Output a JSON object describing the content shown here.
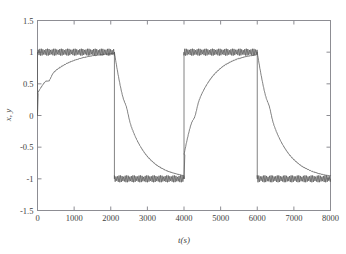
{
  "figure": {
    "scan_artifact_text": "· ·· ·· ···· ··· · ···· ·· ···· ··· ·· ····· ··· ··",
    "background_color": "#ffffff",
    "axis_color": "#8d8d93",
    "trace_color": "#585858"
  },
  "chart_data": {
    "type": "line",
    "title": "",
    "xlabel": "t(s)",
    "ylabel": "x, y",
    "xlim": [
      0,
      8000
    ],
    "ylim": [
      -1.5,
      1.5
    ],
    "xticks": [
      0,
      1000,
      2000,
      3000,
      4000,
      5000,
      6000,
      7000,
      8000
    ],
    "xticklabels": [
      "0",
      "1000",
      "2000",
      "3000",
      "4000",
      "5000",
      "6000",
      "7000",
      "8000"
    ],
    "yticks": [
      -1.5,
      -1,
      -0.5,
      0,
      0.5,
      1,
      1.5
    ],
    "yticklabels": [
      "-1.5",
      "-1",
      "-0.5",
      "0",
      "0.5",
      "1",
      "1.5"
    ],
    "grid": false,
    "legend": null,
    "annotations": [],
    "series": [
      {
        "name": "x",
        "description": "reference square wave with high-frequency chattering ripple on plateaus",
        "style": "chattering-square",
        "amplitude": 1.0,
        "ripple_amplitude": 0.055,
        "ripple_period": 42,
        "switch_times": [
          0,
          2100,
          4000,
          6000
        ],
        "levels": [
          1,
          -1,
          1,
          -1
        ],
        "start_value": 0
      },
      {
        "name": "y",
        "description": "smooth exponential tracking response with small kink near zero crossing",
        "style": "exponential-tracking",
        "segments": [
          {
            "t_start": 0,
            "t_end": 2100,
            "from": 0.0,
            "to": 1.0,
            "jump_to": 0.35,
            "tau": 620,
            "kink_t": 320,
            "kink_dy": -0.06
          },
          {
            "t_start": 2100,
            "t_end": 4000,
            "from": 1.0,
            "to": -1.0,
            "tau": 520,
            "kink_t": 330,
            "kink_dy": 0.07
          },
          {
            "t_start": 4000,
            "t_end": 6000,
            "from": -1.0,
            "to": 1.0,
            "jump_to": -0.62,
            "tau": 540,
            "kink_t": 300,
            "kink_dy": -0.08
          },
          {
            "t_start": 6000,
            "t_end": 8000,
            "from": 1.0,
            "to": -1.0,
            "tau": 530,
            "kink_t": 330,
            "kink_dy": 0.07
          }
        ]
      }
    ]
  }
}
